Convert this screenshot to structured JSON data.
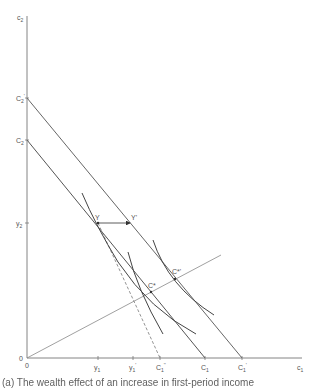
{
  "diagram": {
    "type": "economics-two-period-consumption",
    "axes": {
      "y_axis_label": "c",
      "y_axis_sub": "2",
      "x_axis_label": "c",
      "x_axis_sub": "1",
      "origin_label": "0"
    },
    "y_axis_ticks": [
      {
        "label": "C",
        "sub": "2",
        "prime": "'",
        "id": "C2-prime"
      },
      {
        "label": "C",
        "sub": "2",
        "prime": "",
        "id": "C2"
      },
      {
        "label": "y",
        "sub": "2",
        "prime": "",
        "id": "y2"
      },
      {
        "label": "0",
        "sub": "",
        "prime": "",
        "id": "origin"
      }
    ],
    "x_axis_ticks": [
      {
        "label": "y",
        "sub": "1",
        "prime": "",
        "id": "y1"
      },
      {
        "label": "y",
        "sub": "1",
        "prime": "'",
        "id": "y1-prime"
      },
      {
        "label": "C",
        "sub": "1",
        "prime": "''",
        "id": "C1-double-prime"
      },
      {
        "label": "C",
        "sub": "1",
        "prime": "",
        "id": "C1"
      },
      {
        "label": "C",
        "sub": "1",
        "prime": "'",
        "id": "C1-prime"
      }
    ],
    "points": [
      {
        "label": "Y",
        "id": "endowment-Y"
      },
      {
        "label": "Y'",
        "id": "endowment-Y-prime"
      },
      {
        "label": "C*",
        "id": "optimum-C-star"
      },
      {
        "label": "C*'",
        "id": "optimum-C-star-prime"
      }
    ],
    "lines": [
      {
        "id": "budget-line-upper",
        "from": "C2'",
        "to": "C1'",
        "style": "solid"
      },
      {
        "id": "budget-line-lower",
        "from": "C2",
        "to": "C1",
        "style": "solid"
      },
      {
        "id": "steep-line-through-Y",
        "from": "Y",
        "to": "C1''",
        "style": "dashed"
      },
      {
        "id": "expansion-ray",
        "from": "0",
        "through": [
          "C*",
          "C*'"
        ],
        "style": "solid"
      },
      {
        "id": "shift-arrow",
        "from": "Y",
        "to": "Y'",
        "style": "arrow"
      }
    ],
    "indifference_curves": [
      {
        "id": "ic-through-Y"
      },
      {
        "id": "ic-through-C-star"
      },
      {
        "id": "ic-through-C-star-prime"
      }
    ]
  },
  "caption": {
    "text": "(a) The wealth effect of an increase in first-period income"
  }
}
